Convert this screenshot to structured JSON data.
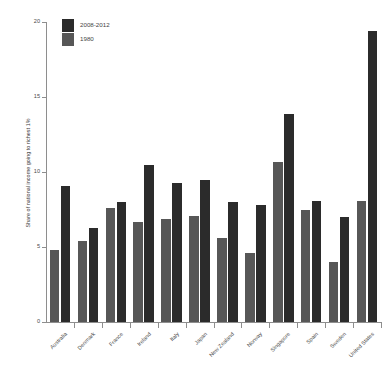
{
  "chart_data": {
    "type": "bar",
    "title": "",
    "subtitle": "",
    "xlabel": "",
    "ylabel": "Share of national income going to richest 1%",
    "ylim": [
      0,
      20
    ],
    "yticks": [
      0,
      5,
      10,
      15,
      20
    ],
    "ytick_labels": [
      "0",
      "5",
      "10",
      "15",
      "20"
    ],
    "grid": false,
    "legend_position": "top-left",
    "categories": [
      "Australia",
      "Denmark",
      "France",
      "Ireland",
      "Italy",
      "Japan",
      "New Zealand",
      "Norway",
      "Singapore",
      "Spain",
      "Sweden",
      "United States"
    ],
    "series": [
      {
        "name": "1980",
        "color": "#575757",
        "values": [
          4.8,
          5.4,
          7.6,
          6.7,
          6.9,
          7.1,
          5.6,
          4.6,
          10.7,
          7.5,
          4.0,
          8.1
        ]
      },
      {
        "name": "2008-2012",
        "color": "#2b2b2b",
        "values": [
          9.1,
          6.3,
          8.0,
          10.5,
          9.3,
          9.5,
          8.0,
          7.8,
          13.9,
          8.1,
          7.0,
          19.4
        ]
      }
    ]
  },
  "legend": {
    "items": [
      {
        "label": "2008-2012",
        "color": "#2b2b2b"
      },
      {
        "label": "1980",
        "color": "#575757"
      }
    ]
  },
  "axes": {
    "y_title": "Share of national income going to richest 1%"
  }
}
